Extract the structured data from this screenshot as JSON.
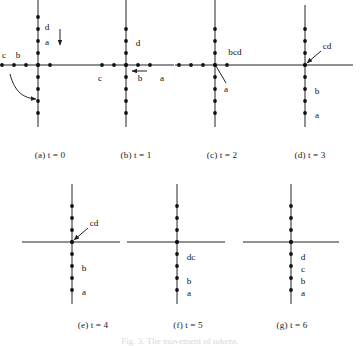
{
  "figure": {
    "type": "diagram",
    "axis_color": "#222222",
    "dot_color": "#111111",
    "label_color": "#111111",
    "bottom_caption": "Fig. 3.  The movement of tokens."
  },
  "panels": [
    {
      "id": "a",
      "caption": "(a) t = 0",
      "caption_x": 50,
      "caption_y": 150,
      "origin": {
        "x": 38,
        "y": 65
      },
      "x_axis": {
        "from": -38,
        "to": 48
      },
      "y_axis": {
        "from": -65,
        "to": 62
      },
      "step": 12,
      "dots_x": [
        -3,
        -2,
        -1,
        0,
        1
      ],
      "dots_y": [
        -4,
        -3,
        -2,
        -1,
        0,
        1,
        2,
        3,
        4
      ],
      "labels": [
        {
          "text": "c",
          "x": -34,
          "y": -9,
          "anchor": "middle"
        },
        {
          "text": "b",
          "x": -20,
          "y": -9,
          "anchor": "middle"
        },
        {
          "text": "a",
          "x": 9,
          "y": -22,
          "anchor": "middle"
        },
        {
          "text": "d",
          "x": 9,
          "y": -37,
          "anchor": "middle"
        }
      ],
      "straight_arrow": {
        "x1": 22,
        "y1": -36,
        "x2": 22,
        "y2": -20
      },
      "curved_arrow": {
        "d": "M -28 9 C -23 28, -14 33, -2 34"
      }
    },
    {
      "id": "b",
      "caption": "(b) t = 1",
      "caption_x": 136,
      "caption_y": 150,
      "origin": {
        "x": 126,
        "y": 65
      },
      "x_axis": {
        "from": -40,
        "to": 48
      },
      "y_axis": {
        "from": -65,
        "to": 62
      },
      "step": 12,
      "dots_x": [
        -2,
        -1,
        0,
        1,
        2
      ],
      "dots_y": [
        -3,
        -2,
        -1,
        0,
        1,
        2,
        3,
        4
      ],
      "labels": [
        {
          "text": "c",
          "x": -26,
          "y": 14,
          "anchor": "middle"
        },
        {
          "text": "b",
          "x": 14,
          "y": 14,
          "anchor": "middle"
        },
        {
          "text": "a",
          "x": 36,
          "y": 14,
          "anchor": "middle"
        },
        {
          "text": "d",
          "x": 12,
          "y": -21,
          "anchor": "middle"
        }
      ],
      "left_arrow": {
        "x1": 21,
        "y1": 6,
        "x2": 6,
        "y2": 6
      }
    },
    {
      "id": "c",
      "caption": "(c) t = 2",
      "caption_x": 222,
      "caption_y": 150,
      "origin": {
        "x": 215,
        "y": 65
      },
      "x_axis": {
        "from": -40,
        "to": 45
      },
      "y_axis": {
        "from": -65,
        "to": 62
      },
      "step": 12,
      "dots_x": [
        -3,
        -2,
        -1,
        0,
        1
      ],
      "dots_y": [
        -3,
        -2,
        -1,
        0,
        1,
        2,
        3,
        4
      ],
      "labels": [
        {
          "text": "bcd",
          "x": 20,
          "y": -12,
          "anchor": "middle"
        },
        {
          "text": "a",
          "x": 11,
          "y": 25,
          "anchor": "middle"
        }
      ],
      "leader_line": {
        "x1": 1,
        "y1": 1,
        "x2": 11,
        "y2": 18
      }
    },
    {
      "id": "d",
      "caption": "(d) t = 3",
      "caption_x": 310,
      "caption_y": 150,
      "origin": {
        "x": 305,
        "y": 65
      },
      "x_axis": {
        "from": -45,
        "to": 48
      },
      "y_axis": {
        "from": -60,
        "to": 62
      },
      "step": 12,
      "dots_x": [
        0
      ],
      "dots_y": [
        -3,
        -2,
        -1,
        0,
        1,
        2,
        3,
        4
      ],
      "labels": [
        {
          "text": "cd",
          "x": 22,
          "y": -18,
          "anchor": "middle"
        },
        {
          "text": "b",
          "x": 12,
          "y": 27,
          "anchor": "middle"
        },
        {
          "text": "a",
          "x": 12,
          "y": 51,
          "anchor": "middle"
        }
      ],
      "arrow_to_origin": {
        "x1": 16,
        "y1": -14,
        "x2": 2,
        "y2": -2
      }
    },
    {
      "id": "e",
      "caption": "(e) t = 4",
      "caption_x": 93,
      "caption_y": 320,
      "origin": {
        "x": 72,
        "y": 242
      },
      "x_axis": {
        "from": -50,
        "to": 48
      },
      "y_axis": {
        "from": -58,
        "to": 62
      },
      "step": 12,
      "dots_x": [
        0
      ],
      "dots_y": [
        -3,
        -2,
        -1,
        0,
        1,
        2,
        3,
        4
      ],
      "labels": [
        {
          "text": "cd",
          "x": 22,
          "y": -18,
          "anchor": "middle"
        },
        {
          "text": "b",
          "x": 12,
          "y": 27,
          "anchor": "middle"
        },
        {
          "text": "a",
          "x": 12,
          "y": 51,
          "anchor": "middle"
        }
      ],
      "arrow_to_origin": {
        "x1": 16,
        "y1": -14,
        "x2": 2,
        "y2": -2
      }
    },
    {
      "id": "f",
      "caption": "(f) t = 5",
      "caption_x": 188,
      "caption_y": 320,
      "origin": {
        "x": 177,
        "y": 242
      },
      "x_axis": {
        "from": -50,
        "to": 48
      },
      "y_axis": {
        "from": -58,
        "to": 62
      },
      "step": 12,
      "dots_x": [
        0
      ],
      "dots_y": [
        -3,
        -2,
        -1,
        0,
        1,
        2,
        3,
        4
      ],
      "labels": [
        {
          "text": "dc",
          "x": 14,
          "y": 16,
          "anchor": "middle"
        },
        {
          "text": "b",
          "x": 12,
          "y": 40,
          "anchor": "middle"
        },
        {
          "text": "a",
          "x": 12,
          "y": 52,
          "anchor": "middle"
        }
      ]
    },
    {
      "id": "g",
      "caption": "(g) t = 6",
      "caption_x": 292,
      "caption_y": 320,
      "origin": {
        "x": 291,
        "y": 242
      },
      "x_axis": {
        "from": -48,
        "to": 48
      },
      "y_axis": {
        "from": -58,
        "to": 62
      },
      "step": 12,
      "dots_x": [
        0
      ],
      "dots_y": [
        -3,
        -2,
        -1,
        0,
        1,
        2,
        3,
        4
      ],
      "labels": [
        {
          "text": "d",
          "x": 12,
          "y": 16,
          "anchor": "middle"
        },
        {
          "text": "c",
          "x": 12,
          "y": 28,
          "anchor": "middle"
        },
        {
          "text": "b",
          "x": 12,
          "y": 40,
          "anchor": "middle"
        },
        {
          "text": "a",
          "x": 12,
          "y": 52,
          "anchor": "middle"
        }
      ]
    }
  ]
}
